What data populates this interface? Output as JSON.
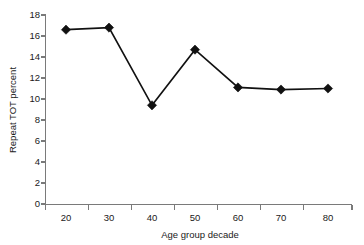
{
  "chart_data": {
    "type": "line",
    "title": "",
    "xlabel": "Age group decade",
    "ylabel": "Repeat TOT percent",
    "categories": [
      "20",
      "30",
      "40",
      "50",
      "60",
      "70",
      "80"
    ],
    "values": [
      16.6,
      16.8,
      9.4,
      14.7,
      11.1,
      10.9,
      11.0
    ],
    "series": [
      {
        "name": "Repeat TOT percent",
        "values": [
          16.6,
          16.8,
          9.4,
          14.7,
          11.1,
          10.9,
          11.0
        ]
      }
    ],
    "x": [
      20,
      30,
      40,
      50,
      60,
      70,
      80
    ],
    "ylim": [
      0,
      18
    ],
    "ytick_labels": [
      "0",
      "2",
      "4",
      "6",
      "8",
      "10",
      "12",
      "14",
      "16",
      "18"
    ],
    "ytick_values": [
      0,
      2,
      4,
      6,
      8,
      10,
      12,
      14,
      16,
      18
    ],
    "xtick_labels": [
      "20",
      "30",
      "40",
      "50",
      "60",
      "70",
      "80"
    ],
    "grid": false,
    "legend": false,
    "legend_position": "none",
    "marker": "diamond",
    "line_color": "#111111",
    "marker_color": "#111111",
    "axis_color": "#7a7a7a",
    "background_color": "#ffffff"
  }
}
